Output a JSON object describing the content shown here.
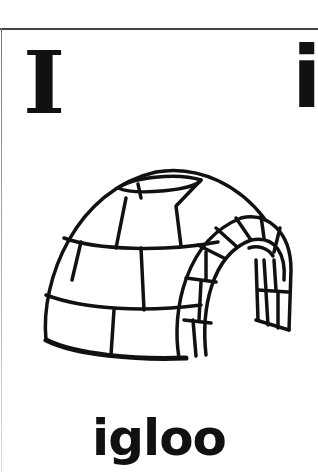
{
  "card": {
    "uppercase_letter": "I",
    "lowercase_letter": "i",
    "word": "igloo",
    "illustration": "igloo-line-drawing",
    "colors": {
      "ink": "#111111",
      "background": "#ffffff",
      "border": "#444444"
    }
  }
}
